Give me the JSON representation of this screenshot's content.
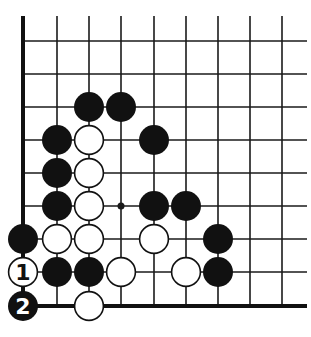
{
  "diagram": {
    "type": "go-board-corner",
    "corner": "bottom-left",
    "grid": {
      "columns_x": [
        23,
        57,
        89,
        121,
        154,
        186,
        218,
        250,
        282
      ],
      "rows_y": [
        41,
        74,
        107,
        140,
        173,
        206,
        239,
        272,
        306
      ],
      "top_y": 16,
      "right_x": 307,
      "line_color": "#1a1a1a",
      "edge_color": "#111111"
    },
    "star_points": [
      {
        "col": 3,
        "row": 5
      }
    ],
    "stone_radius": 15,
    "stones": [
      {
        "color": "black",
        "col": 2,
        "row": 2,
        "label": ""
      },
      {
        "color": "black",
        "col": 3,
        "row": 2,
        "label": ""
      },
      {
        "color": "black",
        "col": 1,
        "row": 3,
        "label": ""
      },
      {
        "color": "white",
        "col": 2,
        "row": 3,
        "label": ""
      },
      {
        "color": "black",
        "col": 4,
        "row": 3,
        "label": ""
      },
      {
        "color": "black",
        "col": 1,
        "row": 4,
        "label": ""
      },
      {
        "color": "white",
        "col": 2,
        "row": 4,
        "label": ""
      },
      {
        "color": "black",
        "col": 1,
        "row": 5,
        "label": ""
      },
      {
        "color": "white",
        "col": 2,
        "row": 5,
        "label": ""
      },
      {
        "color": "black",
        "col": 4,
        "row": 5,
        "label": ""
      },
      {
        "color": "black",
        "col": 5,
        "row": 5,
        "label": ""
      },
      {
        "color": "black",
        "col": 0,
        "row": 6,
        "label": ""
      },
      {
        "color": "white",
        "col": 1,
        "row": 6,
        "label": ""
      },
      {
        "color": "white",
        "col": 2,
        "row": 6,
        "label": ""
      },
      {
        "color": "white",
        "col": 4,
        "row": 6,
        "label": ""
      },
      {
        "color": "black",
        "col": 6,
        "row": 6,
        "label": ""
      },
      {
        "color": "white",
        "col": 0,
        "row": 7,
        "label": "1"
      },
      {
        "color": "black",
        "col": 1,
        "row": 7,
        "label": ""
      },
      {
        "color": "black",
        "col": 2,
        "row": 7,
        "label": ""
      },
      {
        "color": "white",
        "col": 3,
        "row": 7,
        "label": ""
      },
      {
        "color": "white",
        "col": 5,
        "row": 7,
        "label": ""
      },
      {
        "color": "black",
        "col": 6,
        "row": 7,
        "label": ""
      },
      {
        "color": "black",
        "col": 0,
        "row": 8,
        "label": "2"
      },
      {
        "color": "white",
        "col": 2,
        "row": 8,
        "label": ""
      }
    ],
    "move_labels": [
      {
        "number": "1",
        "color": "white"
      },
      {
        "number": "2",
        "color": "black"
      }
    ],
    "colors": {
      "black_stone": "#111111",
      "white_stone": "#ffffff",
      "white_stone_outline": "#111111",
      "background": "#ffffff"
    }
  }
}
